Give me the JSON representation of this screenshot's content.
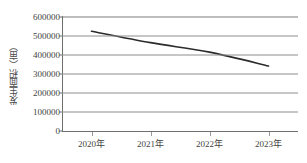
{
  "chart_data": {
    "type": "line",
    "title": "",
    "xlabel": "",
    "ylabel": "发生面积（亩）",
    "categories": [
      "2020年",
      "2021年",
      "2022年",
      "2023年"
    ],
    "series": [
      {
        "name": "发生面积",
        "values": [
          525000,
          465000,
          415000,
          342000
        ]
      }
    ],
    "ylim": [
      0,
      600000
    ],
    "ytick_labels": [
      "0",
      "100000",
      "200000",
      "300000",
      "400000",
      "500000",
      "600000"
    ],
    "ytick_values": [
      0,
      100000,
      200000,
      300000,
      400000,
      500000,
      600000
    ],
    "grid": true,
    "legend": "none",
    "line_color": "#2b2b2b",
    "grid_color": "#8e8e8e",
    "axis_color": "#6e6e6e",
    "background_color": "#ffffff"
  }
}
